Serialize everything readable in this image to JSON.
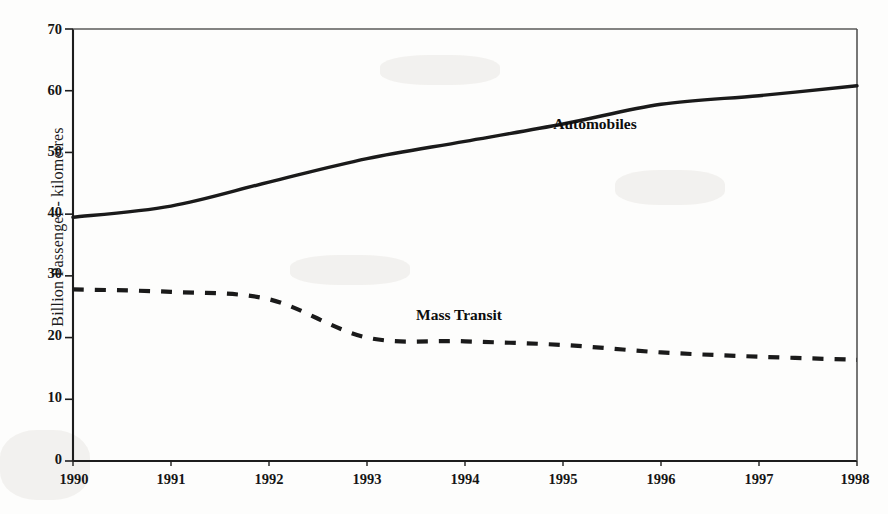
{
  "chart_data": {
    "type": "line",
    "title": "",
    "subtitle": "",
    "xlabel": "",
    "ylabel": "Billion Passenger - kilometres",
    "x": [
      1990,
      1991,
      1992,
      1993,
      1994,
      1995,
      1996,
      1997,
      1998
    ],
    "categories": [
      "1990",
      "1991",
      "1992",
      "1993",
      "1994",
      "1995",
      "1996",
      "1997",
      "1998"
    ],
    "xlim": [
      1990,
      1998
    ],
    "ylim": [
      0,
      70
    ],
    "yticks": [
      0,
      10,
      20,
      30,
      40,
      50,
      60,
      70
    ],
    "ytick_labels": [
      "0",
      "10",
      "20",
      "30",
      "40",
      "50",
      "60",
      "70"
    ],
    "xticks": [
      1990,
      1991,
      1992,
      1993,
      1994,
      1995,
      1996,
      1997,
      1998
    ],
    "xtick_labels": [
      "1990",
      "1991",
      "1992",
      "1993",
      "1994",
      "1995",
      "1996",
      "1997",
      "1998"
    ],
    "grid": false,
    "legend_position": "inline-annotation",
    "series": [
      {
        "name": "Automobiles",
        "style": "solid",
        "color": "#1a1a1a",
        "label_x": 1994.9,
        "label_y": 54.5,
        "values": [
          39.5,
          41.3,
          45.2,
          49.0,
          51.8,
          54.6,
          57.8,
          59.2,
          60.8
        ]
      },
      {
        "name": "Mass Transit",
        "style": "dashed",
        "color": "#1a1a1a",
        "label_x": 1993.5,
        "label_y": 23.5,
        "values": [
          27.8,
          27.4,
          26.2,
          20.0,
          19.4,
          18.8,
          17.6,
          16.9,
          16.4
        ]
      }
    ]
  },
  "axes": {
    "y_axis_title": "Billion Passenger - kilometres"
  }
}
